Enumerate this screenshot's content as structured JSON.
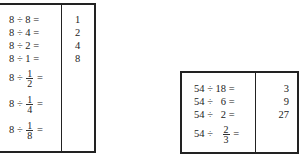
{
  "left_table": {
    "rows": [
      {
        "prefix": "8 ÷ 8 =",
        "answer": "1"
      },
      {
        "prefix": "8 ÷ 4 =",
        "answer": "2"
      },
      {
        "prefix": "8 ÷ 2 =",
        "answer": "4"
      },
      {
        "prefix": "8 ÷ 1 =",
        "answer": "8"
      },
      {
        "prefix": "8 ÷",
        "num": "1",
        "den": "2",
        "suffix": "="
      },
      {
        "prefix": "8 ÷",
        "num": "1",
        "den": "4",
        "suffix": "="
      },
      {
        "prefix": "8 ÷",
        "num": "1",
        "den": "8",
        "suffix": "="
      }
    ]
  },
  "right_table": {
    "rows": [
      {
        "prefix": "54 ÷ 18 =",
        "answer": "3"
      },
      {
        "prefix": "54 ÷   6 =",
        "answer": "9"
      },
      {
        "prefix": "54 ÷   2 =",
        "answer": "27"
      },
      {
        "prefix": "54 ÷",
        "num": "2",
        "den": "3",
        "suffix": "="
      }
    ]
  }
}
